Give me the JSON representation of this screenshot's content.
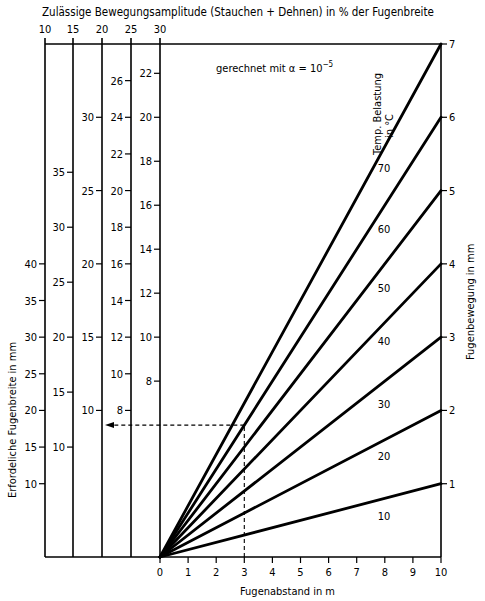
{
  "chart_data": {
    "type": "line",
    "title": "Zulässige Bewegungsamplitude (Stauchen + Dehnen) in % der Fugenbreite",
    "annotation": "gerechnet mit α = 10",
    "annotation_exp": "−5",
    "xlabel": "Fugenabstand in m",
    "ylabel_right": "Fugenbewegung in mm",
    "ylabel_left": "Erfordeliche Fugenbreite in mm",
    "legend_title_line1": "Temp. Belastung",
    "legend_title_line2": "in °C",
    "xlim": [
      0,
      10
    ],
    "ylim_right": [
      0,
      7
    ],
    "x_ticks": [
      0,
      1,
      2,
      3,
      4,
      5,
      6,
      7,
      8,
      9,
      10
    ],
    "y_right_ticks": [
      1,
      2,
      3,
      4,
      5,
      6,
      7
    ],
    "amplitude_columns": [
      {
        "percent": 10,
        "ticks": [
          10,
          15,
          20,
          25,
          30,
          35,
          40
        ]
      },
      {
        "percent": 15,
        "ticks": [
          10,
          15,
          20,
          25,
          30,
          35
        ]
      },
      {
        "percent": 20,
        "ticks": [
          10,
          15,
          20,
          25,
          30
        ]
      },
      {
        "percent": 25,
        "ticks": [
          8,
          10,
          12,
          14,
          16,
          18,
          20,
          22,
          24,
          26
        ]
      },
      {
        "percent": 30,
        "ticks": [
          8,
          10,
          12,
          14,
          16,
          18,
          20,
          22
        ]
      }
    ],
    "series": [
      {
        "name": "10",
        "x": [
          0,
          10
        ],
        "values": [
          0,
          1
        ]
      },
      {
        "name": "20",
        "x": [
          0,
          10
        ],
        "values": [
          0,
          2
        ]
      },
      {
        "name": "30",
        "x": [
          0,
          10
        ],
        "values": [
          0,
          3
        ]
      },
      {
        "name": "40",
        "x": [
          0,
          10
        ],
        "values": [
          0,
          4
        ]
      },
      {
        "name": "50",
        "x": [
          0,
          10
        ],
        "values": [
          0,
          5
        ]
      },
      {
        "name": "60",
        "x": [
          0,
          10
        ],
        "values": [
          0,
          6
        ]
      },
      {
        "name": "70",
        "x": [
          0,
          10
        ],
        "values": [
          0,
          7
        ]
      }
    ],
    "example_reading": {
      "fugenabstand_m": 3,
      "temperature_c": 60,
      "fugenbewegung_mm": 1.8,
      "amplitude_percent": 10,
      "fugenbreite_mm": 18
    },
    "grid": false
  }
}
